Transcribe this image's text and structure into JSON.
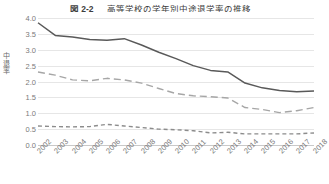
{
  "figure": {
    "number": "図 2-2",
    "title": "高等学校の学年別中途退学率の推移"
  },
  "chart_data": {
    "type": "line",
    "title": "高等学校の学年別中途退学率の推移",
    "xlabel": "",
    "ylabel": "中退率",
    "ylim": [
      0.0,
      4.0
    ],
    "ytick_labels": [
      "0.0",
      "0.5",
      "1.0",
      "1.5",
      "2.0",
      "2.5",
      "3.0",
      "3.5",
      "4.0"
    ],
    "ytick_values": [
      0.0,
      0.5,
      1.0,
      1.5,
      2.0,
      2.5,
      3.0,
      3.5,
      4.0
    ],
    "grid": true,
    "legend_position": "none",
    "categories": [
      "2002",
      "2003",
      "2004",
      "2005",
      "2006",
      "2007",
      "2008",
      "2009",
      "2010",
      "2011",
      "2012",
      "2013",
      "2014",
      "2015",
      "2016",
      "2017",
      "2018"
    ],
    "series": [
      {
        "name": "第1学年",
        "style": "solid",
        "color": "#595959",
        "values": [
          3.85,
          3.45,
          3.4,
          3.32,
          3.3,
          3.35,
          3.15,
          2.92,
          2.72,
          2.5,
          2.35,
          2.3,
          1.95,
          1.8,
          1.72,
          1.68,
          1.7
        ]
      },
      {
        "name": "第2学年",
        "style": "dashed",
        "color": "#a6a6a6",
        "values": [
          2.3,
          2.2,
          2.05,
          2.02,
          2.1,
          2.05,
          1.95,
          1.78,
          1.62,
          1.55,
          1.52,
          1.48,
          1.18,
          1.12,
          1.02,
          1.08,
          1.18
        ]
      },
      {
        "name": "第3学年",
        "style": "dotted",
        "color": "#8c8c8c",
        "values": [
          0.6,
          0.58,
          0.57,
          0.58,
          0.65,
          0.6,
          0.55,
          0.5,
          0.48,
          0.45,
          0.38,
          0.4,
          0.35,
          0.35,
          0.35,
          0.35,
          0.38
        ]
      }
    ]
  },
  "colors": {
    "grid": "#e6e6e6",
    "axis": "#c9c9c9",
    "text": "#7a7a7a"
  }
}
